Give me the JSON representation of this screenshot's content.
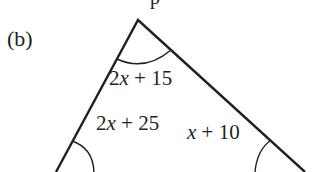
{
  "part_label": "(b)",
  "top_cut_text": "p",
  "triangle": {
    "apex": [
      138,
      20
    ],
    "left_base": [
      56,
      172
    ],
    "right_base": [
      305,
      172
    ],
    "stroke_color": "#231f20"
  },
  "angles": {
    "top": {
      "coef": "2",
      "var": "x",
      "rest": " + 15"
    },
    "bottom_left": {
      "coef": "2",
      "var": "x",
      "rest": " + 25"
    },
    "bottom_right": {
      "coef": "",
      "var": "x",
      "rest": " + 10"
    }
  }
}
